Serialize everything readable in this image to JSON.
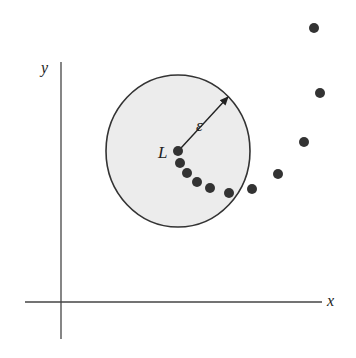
{
  "diagram": {
    "title": "",
    "axes": {
      "x_label": "x",
      "y_label": "y",
      "origin": [
        61,
        302
      ],
      "x_end": 322,
      "x_start": 25,
      "y_top": 62,
      "y_bottom": 339,
      "color": "#444444"
    },
    "neighborhood": {
      "center_label": "L",
      "radius_label": "ε",
      "center": [
        178,
        151
      ],
      "rx": 72,
      "ry": 76,
      "fill": "#ececec",
      "stroke": "#333333"
    },
    "arrow": {
      "from": [
        181,
        148
      ],
      "to": [
        228,
        97
      ]
    },
    "points": [
      [
        314,
        28
      ],
      [
        320,
        93
      ],
      [
        304,
        142
      ],
      [
        278,
        174
      ],
      [
        252,
        189
      ],
      [
        229,
        193
      ],
      [
        210,
        188
      ],
      [
        197,
        182
      ],
      [
        187,
        173
      ],
      [
        180,
        163
      ],
      [
        178,
        151
      ]
    ],
    "point_color": "#333333",
    "point_radius": 5
  }
}
